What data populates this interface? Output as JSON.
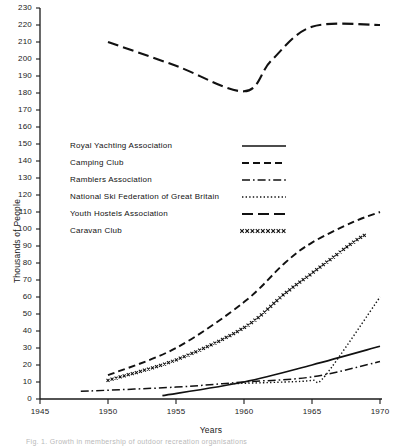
{
  "chart_data": {
    "type": "line",
    "title": "",
    "xlabel": "Years",
    "ylabel": "Thousands of People",
    "xlim": [
      1945,
      1970
    ],
    "ylim": [
      0,
      230
    ],
    "xticks": [
      1945,
      1950,
      1955,
      1960,
      1965,
      1970
    ],
    "xtick_labels": [
      "1945",
      "1950",
      "1955",
      "1960",
      "1965",
      "1970"
    ],
    "yticks": [
      0,
      10,
      20,
      30,
      40,
      50,
      60,
      70,
      80,
      90,
      100,
      110,
      120,
      130,
      140,
      150,
      160,
      170,
      180,
      190,
      200,
      210,
      220,
      230
    ],
    "ytick_labels": [
      "0",
      "10",
      "20",
      "30",
      "40",
      "50",
      "60",
      "70",
      "80",
      "90",
      "100",
      "110",
      "120",
      "130",
      "140",
      "150",
      "160",
      "170",
      "180",
      "190",
      "200",
      "210",
      "220",
      "230"
    ],
    "grid": false,
    "legend_position": "center-left",
    "series": [
      {
        "name": "Royal Yachting Association",
        "style": "solid",
        "x": [
          1954,
          1960,
          1965,
          1970
        ],
        "values": [
          2,
          10,
          20,
          31
        ]
      },
      {
        "name": "Camping Club",
        "style": "dashed",
        "x": [
          1950,
          1955,
          1960,
          1963,
          1965,
          1968,
          1970
        ],
        "values": [
          14,
          30,
          57,
          80,
          92,
          104,
          110
        ]
      },
      {
        "name": "Ramblers Association",
        "style": "dash-dot",
        "x": [
          1948,
          1955,
          1960,
          1965,
          1970
        ],
        "values": [
          4.5,
          7,
          10,
          13,
          22
        ]
      },
      {
        "name": "National Ski Federation of Great Britain",
        "style": "dotted",
        "x": [
          1959,
          1963,
          1965,
          1966,
          1970
        ],
        "values": [
          9,
          10,
          11,
          14,
          60
        ]
      },
      {
        "name": "Youth Hostels Association",
        "style": "long-dash",
        "x": [
          1950,
          1955,
          1960,
          1962,
          1965,
          1970
        ],
        "values": [
          210,
          196,
          181,
          199,
          219,
          220
        ]
      },
      {
        "name": "Caravan Club",
        "style": "x-markers",
        "x": [
          1950,
          1955,
          1960,
          1963,
          1965,
          1968,
          1969
        ],
        "values": [
          11,
          23,
          42,
          62,
          74,
          92,
          97
        ]
      }
    ]
  },
  "legend": {
    "items": [
      {
        "label": "Royal  Yachting  Association",
        "key": "solid"
      },
      {
        "label": "Camping  Club",
        "key": "dashed"
      },
      {
        "label": "Ramblers  Association",
        "key": "dash-dot"
      },
      {
        "label": "National Ski  Federation  of  Great  Britain",
        "key": "dotted"
      },
      {
        "label": "Youth  Hostels   Association",
        "key": "long-dash"
      },
      {
        "label": "Caravan  Club",
        "key": "x-markers"
      }
    ]
  },
  "caption": {
    "text": "Fig. 1.  Growth  in  membership  of  outdoor  recreation  organisations"
  }
}
